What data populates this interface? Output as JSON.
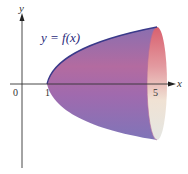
{
  "diagram": {
    "type": "solid-of-revolution",
    "curve_label": "y = f(x)",
    "axes": {
      "x_label": "x",
      "y_label": "y"
    },
    "ticks": [
      {
        "label": "0",
        "value": 0
      },
      {
        "label": "1",
        "value": 1
      },
      {
        "label": "5",
        "value": 5
      }
    ],
    "colors": {
      "solid_dark": "#7e6aa8",
      "solid_mid": "#a26aa6",
      "solid_pink": "#d86a86",
      "end_face_light": "#efe6d6",
      "curve": "#3a3a8a",
      "axis": "#333333",
      "label": "#2a2a7a"
    }
  }
}
